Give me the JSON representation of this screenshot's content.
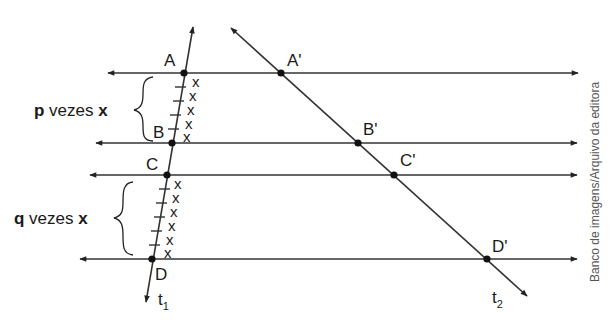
{
  "figure": {
    "colors": {
      "line": "#333333",
      "point": "#111111",
      "text": "#1a1a1a",
      "credit": "#555555"
    }
  },
  "transversals": [
    {
      "name": "t",
      "subscript": "1"
    },
    {
      "name": "t",
      "subscript": "2"
    }
  ],
  "points_t1": [
    "A",
    "B",
    "C",
    "D"
  ],
  "points_t2": [
    "A'",
    "B'",
    "C'",
    "D'"
  ],
  "segments": {
    "AB": {
      "mark": "x",
      "count": 5,
      "brace_prefix": "p",
      "brace_middle": " vezes ",
      "brace_suffix": "x"
    },
    "CD": {
      "mark": "x",
      "count": 6,
      "brace_prefix": "q",
      "brace_middle": " vezes ",
      "brace_suffix": "x"
    }
  },
  "credit": "Banco de imagens/Arquivo da editora"
}
